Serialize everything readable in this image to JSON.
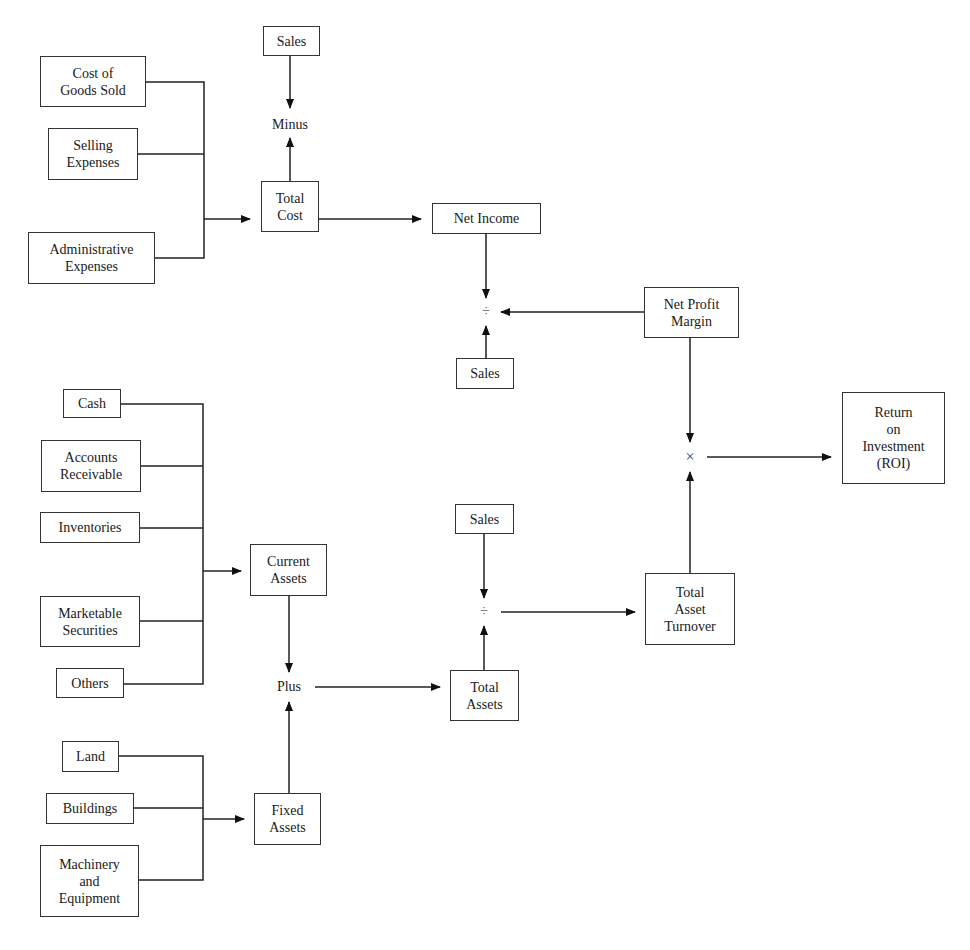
{
  "diagram": {
    "nodes": {
      "sales_top": "Sales",
      "cogs": "Cost of\nGoods Sold",
      "selling": "Selling\nExpenses",
      "admin": "Administrative\nExpenses",
      "total_cost": "Total\nCost",
      "net_income": "Net Income",
      "sales_mid": "Sales",
      "net_profit_margin": "Net Profit\nMargin",
      "roi": "Return\non\nInvestment\n(ROI)",
      "cash": "Cash",
      "ar": "Accounts\nReceivable",
      "inventories": "Inventories",
      "marketable": "Marketable\nSecurities",
      "others": "Others",
      "current_assets": "Current\nAssets",
      "sales_low": "Sales",
      "total_assets": "Total\nAssets",
      "tat": "Total\nAsset\nTurnover",
      "land": "Land",
      "buildings": "Buildings",
      "machinery": "Machinery\nand\nEquipment",
      "fixed_assets": "Fixed\nAssets"
    },
    "operators": {
      "minus": "Minus",
      "divide_top": "÷",
      "multiply": "×",
      "divide_bottom": "÷",
      "plus": "Plus"
    }
  }
}
